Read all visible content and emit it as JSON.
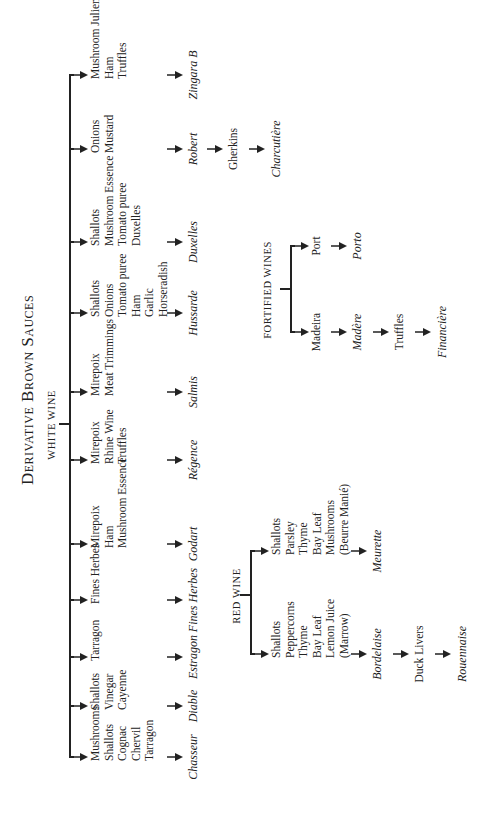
{
  "title": "Derivative Brown Sauces",
  "white_wine": {
    "label": "WHITE WINE",
    "branches": [
      {
        "x": 73,
        "ingredients": [
          "Mushrooms",
          "Shallots",
          "Cognac",
          "Chervil",
          "Tarragon"
        ],
        "sauce": "Chasseur"
      },
      {
        "x": 124,
        "ingredients": [
          "Shallots",
          "Vinegar",
          "Cayenne"
        ],
        "sauce": "Diable"
      },
      {
        "x": 173,
        "ingredients": [
          "Tarragon"
        ],
        "sauce": "Estragon"
      },
      {
        "x": 230,
        "ingredients": [
          "Fines Herbes"
        ],
        "sauce": "Fines Herbes"
      },
      {
        "x": 286,
        "ingredients": [
          "Mirepoix",
          "Ham",
          "Mushroom Essence"
        ],
        "sauce": "Godart"
      },
      {
        "x": 370,
        "ingredients": [
          "Mirepoix",
          "Rhine Wine",
          "Truffles"
        ],
        "sauce": "Régence"
      },
      {
        "x": 438,
        "ingredients": [
          "Mirepoix",
          "Meat Trimmings"
        ],
        "sauce": "Salmis"
      },
      {
        "x": 517,
        "ingredients": [
          "Shallots",
          "Onions",
          "Tomato puree",
          "Ham",
          "Garlic",
          "Horseradish"
        ],
        "sauce": "Hussarde"
      },
      {
        "x": 588,
        "ingredients": [
          "Shallots",
          "Mushroom Essence",
          "Tomato puree",
          "Duxelles"
        ],
        "sauce": "Duxelles"
      },
      {
        "x": 681,
        "ingredients": [
          "Onions",
          "Mustard"
        ],
        "sauce": "Robert",
        "then": [
          {
            "text": "Gherkins",
            "style": "node"
          },
          {
            "text": "Charcutière",
            "style": "sauce"
          }
        ]
      },
      {
        "x": 755,
        "ingredients": [
          "Mushroom Julienne",
          "Ham",
          "Truffles"
        ],
        "sauce": "Zingara B"
      }
    ]
  },
  "red_wine": {
    "label": "RED WINE",
    "branches": [
      {
        "x": 176,
        "ingredients": [
          "Shallots",
          "Peppercorns",
          "Thyme",
          "Bay Leaf",
          "Lemon Juice",
          "(Marrow)"
        ],
        "sauce": "Bordelaise",
        "then": [
          {
            "text": "Duck Livers",
            "style": "node"
          },
          {
            "text": "Rouennaise",
            "style": "sauce"
          }
        ]
      },
      {
        "x": 279,
        "ingredients": [
          "Shallots",
          "Parsley",
          "Thyme",
          "Bay Leaf",
          "Mushrooms",
          "(Beurre Manié)"
        ],
        "sauce": "Meurette"
      }
    ]
  },
  "fortified_wines": {
    "label": "FORTIFIED WINES",
    "branches": [
      {
        "x": 498,
        "ingredient": "Madeira",
        "sauce": "Madère",
        "then": [
          {
            "text": "Truffles",
            "style": "node"
          },
          {
            "text": "Financière",
            "style": "sauce"
          }
        ]
      },
      {
        "x": 584,
        "ingredient": "Port",
        "sauce": "Porto"
      }
    ]
  }
}
